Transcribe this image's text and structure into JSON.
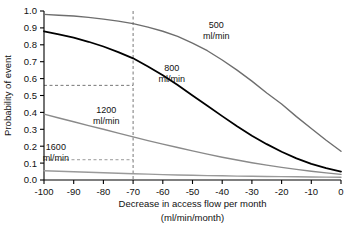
{
  "chart_data": {
    "type": "line",
    "title": "",
    "xlabel": "Decrease in access flow per month",
    "xlabel_units": "(ml/min/month)",
    "ylabel": "Probability of event",
    "xlim": [
      -100,
      0
    ],
    "ylim": [
      0.0,
      1.0
    ],
    "grid": false,
    "legend_position": "inline-annotations",
    "xticks": [
      -100,
      -90,
      -80,
      -70,
      -60,
      -50,
      -40,
      -30,
      -20,
      -10,
      0
    ],
    "xtick_labels": [
      "-100",
      "-90",
      "-80",
      "-70",
      "-60",
      "-50",
      "-40",
      "-30",
      "-20",
      "-10",
      "0"
    ],
    "yticks": [
      0.0,
      0.1,
      0.2,
      0.3,
      0.4,
      0.5,
      0.6,
      0.7,
      0.8,
      0.9,
      1.0
    ],
    "ytick_labels": [
      "0.0",
      "0.1",
      "0.2",
      "0.3",
      "0.4",
      "0.5",
      "0.6",
      "0.7",
      "0.8",
      "0.9",
      "1.0"
    ],
    "x": [
      -100,
      -95,
      -90,
      -85,
      -80,
      -75,
      -70,
      -65,
      -60,
      -55,
      -50,
      -45,
      -40,
      -35,
      -30,
      -25,
      -20,
      -15,
      -10,
      -5,
      0
    ],
    "series": [
      {
        "name": "500",
        "label": "500",
        "label_units": "ml/min",
        "color": "#6e6e6e",
        "width": 1.4,
        "label_x": -42,
        "label_y": 0.9,
        "values": [
          0.98,
          0.975,
          0.97,
          0.962,
          0.952,
          0.94,
          0.925,
          0.905,
          0.88,
          0.85,
          0.81,
          0.765,
          0.71,
          0.65,
          0.585,
          0.515,
          0.45,
          0.375,
          0.305,
          0.235,
          0.17
        ]
      },
      {
        "name": "800",
        "label": "800",
        "label_units": "ml/min",
        "color": "#000000",
        "width": 1.8,
        "label_x": -57,
        "label_y": 0.645,
        "values": [
          0.88,
          0.862,
          0.842,
          0.818,
          0.79,
          0.757,
          0.72,
          0.672,
          0.62,
          0.562,
          0.5,
          0.44,
          0.378,
          0.318,
          0.262,
          0.212,
          0.167,
          0.128,
          0.095,
          0.07,
          0.05
        ]
      },
      {
        "name": "1200",
        "label": "1200",
        "label_units": "ml/min",
        "color": "#8a8a8a",
        "width": 1.4,
        "label_x": -79,
        "label_y": 0.395,
        "values": [
          0.39,
          0.367,
          0.345,
          0.322,
          0.3,
          0.277,
          0.255,
          0.233,
          0.212,
          0.192,
          0.172,
          0.153,
          0.135,
          0.118,
          0.102,
          0.088,
          0.075,
          0.063,
          0.052,
          0.042,
          0.033
        ]
      },
      {
        "name": "1600",
        "label": "1600",
        "label_units": "ml/min",
        "color": "#9a9a9a",
        "width": 1.4,
        "label_x": -96,
        "label_y": 0.175,
        "values": [
          0.055,
          0.052,
          0.049,
          0.046,
          0.043,
          0.04,
          0.037,
          0.035,
          0.032,
          0.03,
          0.028,
          0.026,
          0.025,
          0.023,
          0.022,
          0.021,
          0.02,
          0.019,
          0.018,
          0.017,
          0.016
        ]
      }
    ],
    "reference_lines": [
      {
        "name": "vline-70",
        "orientation": "vertical",
        "value": -70,
        "style": "dashed",
        "color": "#777"
      },
      {
        "name": "hline-0.56",
        "orientation": "horizontal",
        "value": 0.56,
        "style": "dashed",
        "color": "#777"
      },
      {
        "name": "hline-0.12",
        "orientation": "horizontal",
        "value": 0.12,
        "style": "dashed",
        "color": "#999"
      }
    ]
  }
}
